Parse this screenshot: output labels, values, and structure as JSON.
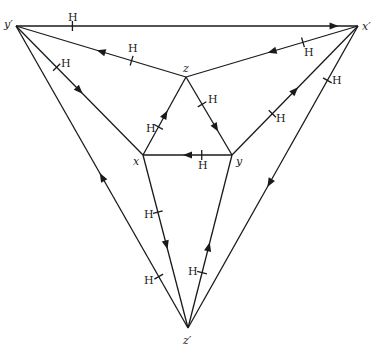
{
  "diagram": {
    "vertices": [
      {
        "id": "y'",
        "label": "y′",
        "x": 16,
        "y": 26,
        "lx": 4,
        "ly": 28
      },
      {
        "id": "x'",
        "label": "x′",
        "x": 358,
        "y": 26,
        "lx": 362,
        "ly": 30
      },
      {
        "id": "z'",
        "label": "z′",
        "x": 188,
        "y": 328,
        "lx": 183,
        "ly": 344
      },
      {
        "id": "z",
        "label": "z",
        "x": 186,
        "y": 77,
        "lx": 183,
        "ly": 72
      },
      {
        "id": "x",
        "label": "x",
        "x": 143,
        "y": 155,
        "lx": 133,
        "ly": 165
      },
      {
        "id": "y",
        "label": "y",
        "x": 232,
        "y": 155,
        "lx": 236,
        "ly": 165
      }
    ],
    "edges": [
      {
        "name": "edge-yprime-xprime",
        "from": "y'",
        "to": "x'",
        "arrow_t": 0.93,
        "tick_t": 0.165,
        "h_label": "H",
        "hx": 68,
        "hy": 21
      },
      {
        "name": "edge-z-yprime",
        "from": "z",
        "to": "y'",
        "arrow_t": 0.5,
        "tick_t": 0.32,
        "h_label": "H",
        "hx": 128,
        "hy": 52
      },
      {
        "name": "edge-xprime-z",
        "from": "x'",
        "to": "z",
        "arrow_t": 0.5,
        "tick_t": 0.32,
        "h_label": "H",
        "hx": 304,
        "hy": 56
      },
      {
        "name": "edge-yprime-x",
        "from": "y'",
        "to": "x",
        "arrow_t": 0.5,
        "tick_t": 0.32,
        "h_label": "H",
        "hx": 61,
        "hy": 67
      },
      {
        "name": "edge-x-z",
        "from": "x",
        "to": "z",
        "arrow_t": 0.52,
        "tick_t": 0.36,
        "h_label": "H",
        "hx": 146,
        "hy": 132
      },
      {
        "name": "edge-z-y",
        "from": "z",
        "to": "y",
        "arrow_t": 0.65,
        "tick_t": 0.35,
        "h_label": "H",
        "hx": 208,
        "hy": 103
      },
      {
        "name": "edge-y-x",
        "from": "y",
        "to": "x",
        "arrow_t": 0.5,
        "tick_t": 0.34,
        "h_label": "H",
        "hx": 198,
        "hy": 169
      },
      {
        "name": "edge-y-xprime",
        "from": "y",
        "to": "x'",
        "arrow_t": 0.5,
        "tick_t": 0.32,
        "h_label": "H",
        "hx": 276,
        "hy": 122
      },
      {
        "name": "edge-xprime-zprime",
        "from": "x'",
        "to": "z'",
        "arrow_t": 0.52,
        "tick_t": 0.18,
        "h_label": "H",
        "hx": 332,
        "hy": 84
      },
      {
        "name": "edge-zprime-yprime",
        "from": "z'",
        "to": "y'",
        "arrow_t": 0.5,
        "tick_t": 0.17,
        "h_label": "H",
        "hx": 144,
        "hy": 284
      },
      {
        "name": "edge-x-zprime",
        "from": "x",
        "to": "z'",
        "arrow_t": 0.52,
        "tick_t": 0.33,
        "h_label": "H",
        "hx": 144,
        "hy": 218
      },
      {
        "name": "edge-zprime-y",
        "from": "z'",
        "to": "y",
        "arrow_t": 0.47,
        "tick_t": 0.32,
        "h_label": "H",
        "hx": 188,
        "hy": 275
      }
    ],
    "colors": {
      "stroke": "#1a1a1a",
      "background": "#ffffff"
    }
  }
}
